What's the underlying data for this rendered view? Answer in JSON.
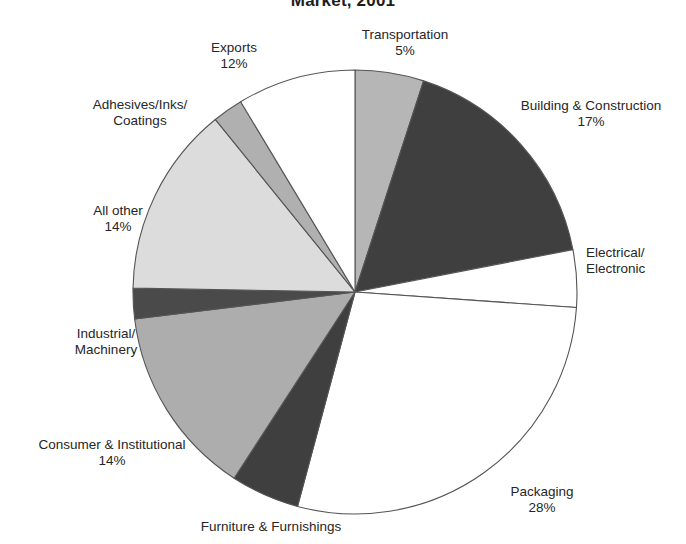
{
  "chart_data": {
    "type": "pie",
    "title": "Market, 2001",
    "title_note": "Title is clipped at the top edge of the screenshot",
    "xlabel": "",
    "ylabel": "",
    "legend": "none (direct slice labels)",
    "grid": false,
    "label_format": "name + percent",
    "start_angle_deg": 0,
    "direction": "clockwise",
    "categories": [
      "Transportation",
      "Building & Construction",
      "Electrical/Electronic",
      "Packaging",
      "Furniture & Furnishings",
      "Consumer & Institutional",
      "Industrial/Machinery",
      "All other",
      "Adhesives/Inks/Coatings",
      "Exports"
    ],
    "values": [
      5,
      17,
      4,
      28,
      5,
      14,
      2,
      14,
      2,
      12
    ],
    "slices": [
      {
        "name": "Transportation",
        "label": "Transportation",
        "percent": 5,
        "percent_label": "5%",
        "fill": "#b6b6b6",
        "start_deg": 0,
        "end_deg": 18
      },
      {
        "name": "Building & Construction",
        "label": "Building & Construction",
        "percent": 17,
        "percent_label": "17%",
        "fill": "#3f3f3f",
        "start_deg": 18,
        "end_deg": 79
      },
      {
        "name": "Electrical/Electronic",
        "label": "Electrical/\nElectronic",
        "label_line1": "Electrical/",
        "label_line2": "Electronic",
        "percent": 4,
        "percent_label": "",
        "fill": "#ffffff",
        "start_deg": 79,
        "end_deg": 94
      },
      {
        "name": "Packaging",
        "label": "Packaging",
        "percent": 28,
        "percent_label": "28%",
        "fill": "#ffffff",
        "start_deg": 94,
        "end_deg": 195
      },
      {
        "name": "Furniture & Furnishings",
        "label": "Furniture & Furnishings",
        "percent": 5,
        "percent_label": "",
        "fill": "#3f3f3f",
        "start_deg": 195,
        "end_deg": 213
      },
      {
        "name": "Consumer & Institutional",
        "label": "Consumer & Institutional",
        "percent": 14,
        "percent_label": "14%",
        "fill": "#adadad",
        "start_deg": 213,
        "end_deg": 263
      },
      {
        "name": "Industrial/Machinery",
        "label": "Industrial/\nMachinery",
        "label_line1": "Industrial/",
        "label_line2": "Machinery",
        "percent": 2,
        "percent_label": "",
        "fill": "#4a4a4a",
        "start_deg": 263,
        "end_deg": 271
      },
      {
        "name": "All other",
        "label": "All other",
        "percent": 14,
        "percent_label": "14%",
        "fill": "#dcdcdc",
        "start_deg": 271,
        "end_deg": 321
      },
      {
        "name": "Adhesives/Inks/Coatings",
        "label": "Adhesives/Inks/\nCoatings",
        "label_line1": "Adhesives/Inks/",
        "label_line2": "Coatings",
        "percent": 2,
        "percent_label": "",
        "fill": "#b0b0b0",
        "start_deg": 321,
        "end_deg": 329
      },
      {
        "name": "Exports",
        "label": "Exports",
        "percent": 12,
        "percent_label": "12%",
        "fill": "#ffffff",
        "start_deg": 329,
        "end_deg": 360
      }
    ]
  },
  "colors": {
    "dark_gray": "#3f3f3f",
    "medium_gray": "#b6b6b6",
    "light_gray": "#dcdcdc",
    "white": "#ffffff",
    "outline": "#555555",
    "text": "#262626"
  }
}
